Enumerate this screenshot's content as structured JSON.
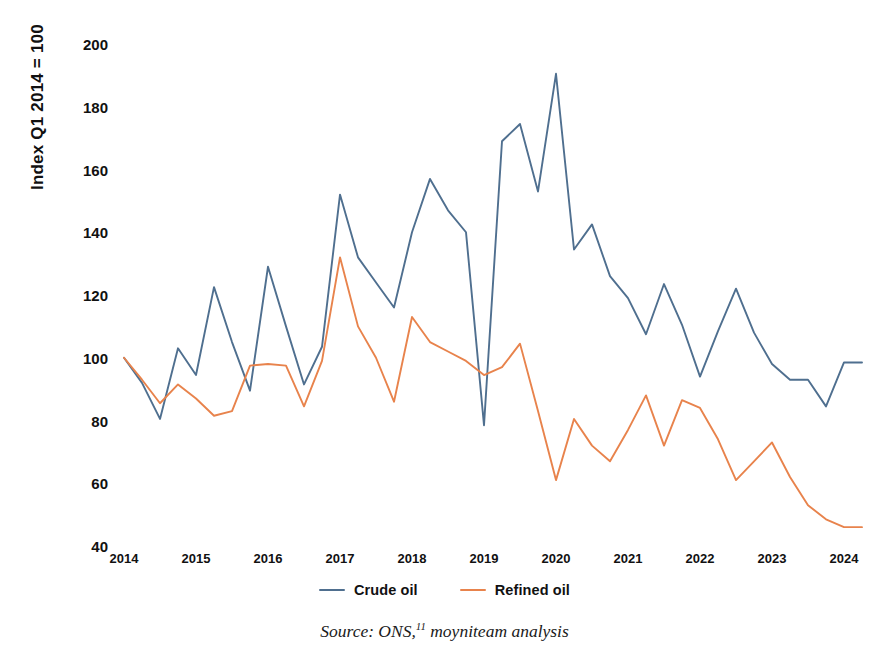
{
  "chart_data": {
    "type": "line",
    "title": "",
    "xlabel": "",
    "ylabel": "Index Q1 2014 = 100",
    "ylim": [
      40,
      200
    ],
    "y_ticks": [
      200,
      180,
      160,
      140,
      120,
      100,
      80,
      60,
      40
    ],
    "x_ticks": [
      "2014",
      "2015",
      "2016",
      "2017",
      "2018",
      "2019",
      "2020",
      "2021",
      "2022",
      "2023",
      "2024"
    ],
    "xlim": [
      "2014 Q1",
      "2024 Q2"
    ],
    "grid": false,
    "legend_position": "bottom-center",
    "x": [
      "2014 Q1",
      "2014 Q2",
      "2014 Q3",
      "2014 Q4",
      "2015 Q1",
      "2015 Q2",
      "2015 Q3",
      "2015 Q4",
      "2016 Q1",
      "2016 Q2",
      "2016 Q3",
      "2016 Q4",
      "2017 Q1",
      "2017 Q2",
      "2017 Q3",
      "2017 Q4",
      "2018 Q1",
      "2018 Q2",
      "2018 Q3",
      "2018 Q4",
      "2019 Q1",
      "2019 Q2",
      "2019 Q3",
      "2019 Q4",
      "2020 Q1",
      "2020 Q2",
      "2020 Q3",
      "2020 Q4",
      "2021 Q1",
      "2021 Q2",
      "2021 Q3",
      "2021 Q4",
      "2022 Q1",
      "2022 Q2",
      "2022 Q3",
      "2022 Q4",
      "2023 Q1",
      "2023 Q2",
      "2023 Q3",
      "2023 Q4",
      "2024 Q1",
      "2024 Q2"
    ],
    "series": [
      {
        "name": "Crude oil",
        "color": "#4F6F8F",
        "values": [
          100,
          92,
          80.5,
          103,
          94.5,
          122.5,
          105,
          89.5,
          129,
          110,
          91.5,
          103.5,
          152,
          132,
          124,
          116,
          140,
          157,
          147,
          140,
          78.5,
          169,
          174.5,
          153,
          190.5,
          134.5,
          142.5,
          126,
          119,
          107.5,
          123.5,
          110.5,
          94,
          108.5,
          122,
          108,
          98,
          93,
          93,
          84.5,
          98.5,
          98.5
        ]
      },
      {
        "name": "Refined oil",
        "color": "#E8834C",
        "values": [
          100,
          93,
          85.5,
          91.5,
          87,
          81.5,
          83,
          97.5,
          98,
          97.5,
          84.5,
          99,
          132,
          110,
          100,
          86,
          113,
          105,
          102,
          99,
          94.5,
          97,
          104.5,
          83,
          61,
          80.5,
          72,
          67,
          77,
          88,
          72,
          86.5,
          84,
          74,
          61,
          67,
          73,
          62,
          53,
          48.5,
          46,
          46
        ]
      }
    ]
  },
  "legend": {
    "entries": [
      {
        "label": "Crude oil",
        "color": "#4F6F8F"
      },
      {
        "label": "Refined oil",
        "color": "#E8834C"
      }
    ]
  },
  "caption": {
    "prefix": "Source: ONS,",
    "footnote": "11",
    "suffix": " moyniteam analysis"
  }
}
